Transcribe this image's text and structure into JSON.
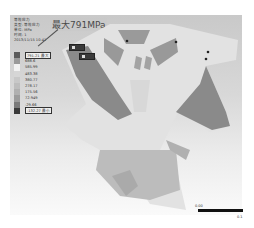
{
  "info_panel": {
    "lines": [
      "等效应力",
      "类型: 等效应力",
      "单位: MPa",
      "时间: 1",
      "2013/11/15 10:41"
    ]
  },
  "callout": {
    "label": "最大791MPa"
  },
  "legend": {
    "items": [
      {
        "value": "791.21 最大",
        "color": "#5a5a5a"
      },
      {
        "value": "688.6",
        "color": "#9a9a9a"
      },
      {
        "value": "585.99",
        "color": "#f2f2f2"
      },
      {
        "value": "483.38",
        "color": "#d6d6d6"
      },
      {
        "value": "380.77",
        "color": "#c8c8c8"
      },
      {
        "value": "278.17",
        "color": "#bdbdbd"
      },
      {
        "value": "175.56",
        "color": "#b0b0b0"
      },
      {
        "value": "72.949",
        "color": "#9c9c9c"
      },
      {
        "value": "-29.66",
        "color": "#7a7a7a"
      },
      {
        "value": "-132.27 最小",
        "color": "#3a3a3a"
      }
    ]
  },
  "scale": {
    "left_label": "0.00",
    "right_label": "0.1"
  },
  "colors": {
    "background": "#ffffff",
    "model_light": "#e6e6e6",
    "model_mid": "#b5b5b5",
    "model_dark": "#7d7d7d"
  }
}
